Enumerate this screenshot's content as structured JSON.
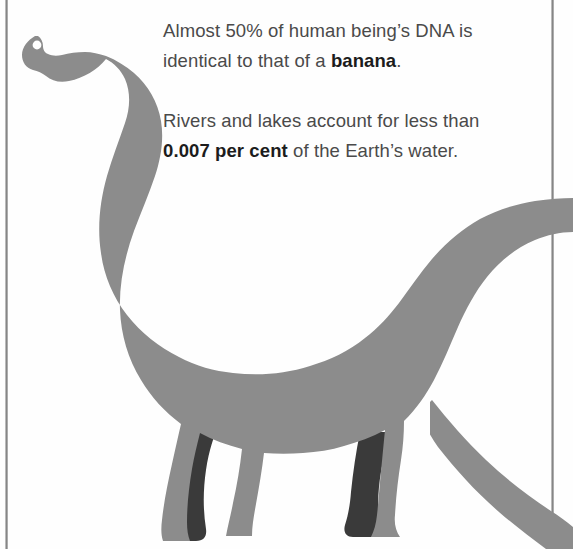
{
  "page": {
    "background_color": "#fefefe",
    "width": 573,
    "height": 549
  },
  "rules": {
    "left_label": "left column rule",
    "right_label": "right column rule",
    "color": "#8f8f8f"
  },
  "illustration": {
    "name": "brachiosaurus-silhouette",
    "alt": "Grey silhouette of a long-necked sauropod dinosaur facing left",
    "body_color": "#8c8c8c",
    "far_leg_color": "#3a3a3a",
    "eye_color": "#ffffff"
  },
  "facts": [
    {
      "id": "fact-dna-banana",
      "segments": [
        {
          "text": "Almost 50% of human being’s DNA is identical to that of a ",
          "bold": false
        },
        {
          "text": "banana",
          "bold": true
        },
        {
          "text": ".",
          "bold": false
        }
      ],
      "plain_text": "Almost 50% of human being’s DNA is identical to that of a banana."
    },
    {
      "id": "fact-rivers-lakes",
      "segments": [
        {
          "text": "Rivers and lakes account for less than ",
          "bold": false
        },
        {
          "text": "0.007 per cent",
          "bold": true
        },
        {
          "text": " of the Earth’s water.",
          "bold": false
        }
      ],
      "plain_text": "Rivers and lakes account for less than 0.007 per cent of the Earth’s water."
    }
  ]
}
